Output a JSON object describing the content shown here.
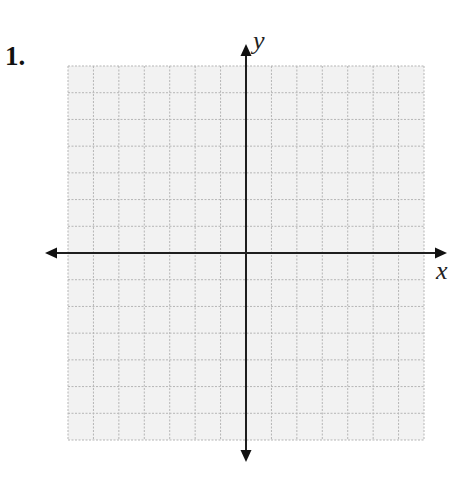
{
  "problem": {
    "number_label": "1."
  },
  "axes": {
    "x_label": "x",
    "y_label": "y"
  },
  "grid": {
    "columns": 14,
    "rows": 14,
    "left": 68,
    "top": 66,
    "right": 424,
    "bottom": 440,
    "fill_color": "#f2f2f2",
    "line_color": "#b8b8b8",
    "line_style": "dashed"
  },
  "origin": {
    "x": 246,
    "y": 253
  },
  "colors": {
    "axis": "#1e1e1e",
    "background": "#ffffff"
  }
}
